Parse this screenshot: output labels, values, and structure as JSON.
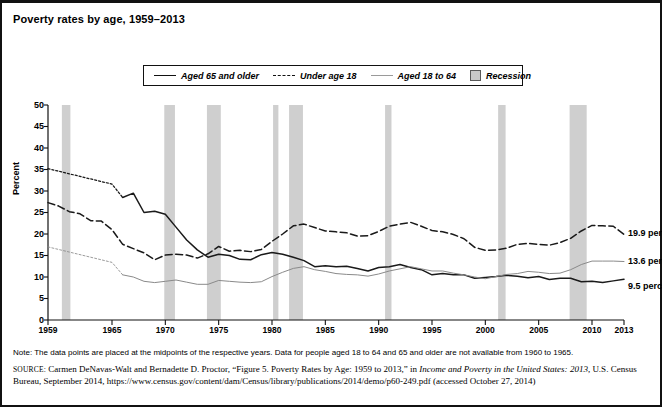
{
  "title": "Poverty rates by age, 1959–2013",
  "legend": {
    "items": [
      {
        "label": "Aged 65 and older",
        "style": "solid",
        "icon": "line-solid-icon"
      },
      {
        "label": "Under age 18",
        "style": "dashed",
        "icon": "line-dashed-icon"
      },
      {
        "label": "Aged 18 to 64",
        "style": "thin",
        "icon": "line-thin-icon"
      },
      {
        "label": "Recession",
        "style": "box",
        "icon": "shaded-box-icon"
      }
    ]
  },
  "annotations": [
    {
      "text": "19.9 percent",
      "series": "Under age 18"
    },
    {
      "text": "13.6 percent",
      "series": "Aged 18 to 64"
    },
    {
      "text": "9.5 percent",
      "series": "Aged 65 and older"
    }
  ],
  "note": "Note: The data points are placed at the midpoints of the respective years. Data for people aged 18 to 64 and 65 and older are not available from 1960 to 1965.",
  "source": {
    "label": "SOURCE:",
    "line1_a": " Carmen DeNavas-Walt and Bernadette D. Proctor, “Figure 5. Poverty Rates by Age: 1959 to 2013,” in ",
    "line1_italic": "Income and Poverty in the United States:",
    "line2_italic": "2013",
    "line2_a": ", U.S. Census Bureau, September 2014, https://www.census.gov/content/dam/Census/library/publications/2014/demo/p60-249.pdf (accessed",
    "line3": "October 27, 2014)"
  },
  "chart_data": {
    "type": "line",
    "title": "Poverty rates by age, 1959–2013",
    "xlabel": "",
    "ylabel": "Percent",
    "ylim": [
      0,
      50
    ],
    "ytick_labels": [
      "0",
      "5",
      "10",
      "15",
      "20",
      "25",
      "30",
      "35",
      "40",
      "45",
      "50"
    ],
    "ytick_values": [
      0,
      5,
      10,
      15,
      20,
      25,
      30,
      35,
      40,
      45,
      50
    ],
    "xlim": [
      1959,
      2013
    ],
    "xtick_labels": [
      "1959",
      "1965",
      "1970",
      "1975",
      "1980",
      "1985",
      "1990",
      "1995",
      "2000",
      "2005",
      "2010",
      "2013"
    ],
    "xtick_values": [
      1959,
      1965,
      1970,
      1975,
      1980,
      1985,
      1990,
      1995,
      2000,
      2005,
      2010,
      2013
    ],
    "grid": false,
    "legend_position": "top-center",
    "series": [
      {
        "name": "Aged 65 and older",
        "style": "solid",
        "color": "#1a1a1a",
        "gap_note": "interpolated 1960-1965 (data not available)",
        "x": [
          1959,
          1960,
          1961,
          1962,
          1963,
          1964,
          1965,
          1966,
          1967,
          1968,
          1969,
          1970,
          1971,
          1972,
          1973,
          1974,
          1975,
          1976,
          1977,
          1978,
          1979,
          1980,
          1981,
          1982,
          1983,
          1984,
          1985,
          1986,
          1987,
          1988,
          1989,
          1990,
          1991,
          1992,
          1993,
          1994,
          1995,
          1996,
          1997,
          1998,
          1999,
          2000,
          2001,
          2002,
          2003,
          2004,
          2005,
          2006,
          2007,
          2008,
          2009,
          2010,
          2011,
          2012,
          2013
        ],
        "y": [
          35.2,
          34.6,
          34.0,
          33.4,
          32.8,
          32.2,
          31.6,
          28.5,
          29.5,
          25.0,
          25.3,
          24.6,
          21.6,
          18.6,
          16.3,
          14.6,
          15.3,
          15.0,
          14.1,
          14.0,
          15.2,
          15.7,
          15.3,
          14.6,
          13.8,
          12.4,
          12.6,
          12.4,
          12.5,
          12.0,
          11.4,
          12.2,
          12.4,
          12.9,
          12.2,
          11.7,
          10.5,
          10.8,
          10.5,
          10.5,
          9.7,
          9.9,
          10.1,
          10.4,
          10.2,
          9.8,
          10.1,
          9.4,
          9.7,
          9.7,
          8.9,
          9.0,
          8.7,
          9.1,
          9.5
        ],
        "label_end": "9.5 percent"
      },
      {
        "name": "Under age 18",
        "style": "dashed",
        "color": "#1a1a1a",
        "x": [
          1959,
          1960,
          1961,
          1962,
          1963,
          1964,
          1965,
          1966,
          1967,
          1968,
          1969,
          1970,
          1971,
          1972,
          1973,
          1974,
          1975,
          1976,
          1977,
          1978,
          1979,
          1980,
          1981,
          1982,
          1983,
          1984,
          1985,
          1986,
          1987,
          1988,
          1989,
          1990,
          1991,
          1992,
          1993,
          1994,
          1995,
          1996,
          1997,
          1998,
          1999,
          2000,
          2001,
          2002,
          2003,
          2004,
          2005,
          2006,
          2007,
          2008,
          2009,
          2010,
          2011,
          2012,
          2013
        ],
        "y": [
          27.3,
          26.5,
          25.2,
          24.7,
          23.1,
          23.0,
          21.0,
          17.6,
          16.6,
          15.6,
          14.0,
          15.1,
          15.3,
          15.1,
          14.4,
          15.4,
          17.1,
          16.0,
          16.2,
          15.9,
          16.4,
          18.3,
          20.0,
          21.9,
          22.3,
          21.5,
          20.7,
          20.5,
          20.3,
          19.5,
          19.6,
          20.6,
          21.8,
          22.3,
          22.7,
          21.8,
          20.8,
          20.5,
          19.9,
          18.9,
          16.9,
          16.2,
          16.3,
          16.7,
          17.6,
          17.8,
          17.6,
          17.4,
          18.0,
          19.0,
          20.7,
          22.0,
          21.9,
          21.8,
          19.9
        ],
        "label_end": "19.9 percent"
      },
      {
        "name": "Aged 18 to 64",
        "style": "thin",
        "color": "#8a8a8a",
        "gap_note": "interpolated 1960-1965 (data not available)",
        "x": [
          1959,
          1960,
          1961,
          1962,
          1963,
          1964,
          1965,
          1966,
          1967,
          1968,
          1969,
          1970,
          1971,
          1972,
          1973,
          1974,
          1975,
          1976,
          1977,
          1978,
          1979,
          1980,
          1981,
          1982,
          1983,
          1984,
          1985,
          1986,
          1987,
          1988,
          1989,
          1990,
          1991,
          1992,
          1993,
          1994,
          1995,
          1996,
          1997,
          1998,
          1999,
          2000,
          2001,
          2002,
          2003,
          2004,
          2005,
          2006,
          2007,
          2008,
          2009,
          2010,
          2011,
          2012,
          2013
        ],
        "y": [
          17.0,
          16.4,
          15.8,
          15.2,
          14.6,
          14.0,
          13.4,
          10.5,
          10.0,
          9.0,
          8.7,
          9.0,
          9.3,
          8.8,
          8.3,
          8.3,
          9.2,
          9.0,
          8.8,
          8.7,
          8.9,
          10.1,
          11.1,
          12.0,
          12.4,
          11.7,
          11.3,
          10.8,
          10.6,
          10.5,
          10.2,
          10.7,
          11.4,
          11.9,
          12.4,
          11.9,
          11.4,
          11.4,
          10.9,
          10.5,
          10.0,
          9.6,
          10.1,
          10.6,
          10.8,
          11.3,
          11.1,
          10.8,
          10.9,
          11.7,
          12.9,
          13.7,
          13.7,
          13.7,
          13.6
        ],
        "label_end": "13.6 percent"
      }
    ],
    "recession_bands": [
      {
        "start": 1960.3,
        "end": 1961.1
      },
      {
        "start": 1969.9,
        "end": 1970.9
      },
      {
        "start": 1973.9,
        "end": 1975.2
      },
      {
        "start": 1980.1,
        "end": 1980.6
      },
      {
        "start": 1981.6,
        "end": 1982.9
      },
      {
        "start": 1990.6,
        "end": 1991.2
      },
      {
        "start": 2001.2,
        "end": 2001.9
      },
      {
        "start": 2007.9,
        "end": 2009.5
      }
    ],
    "recession_color": "#cfcfcf"
  }
}
